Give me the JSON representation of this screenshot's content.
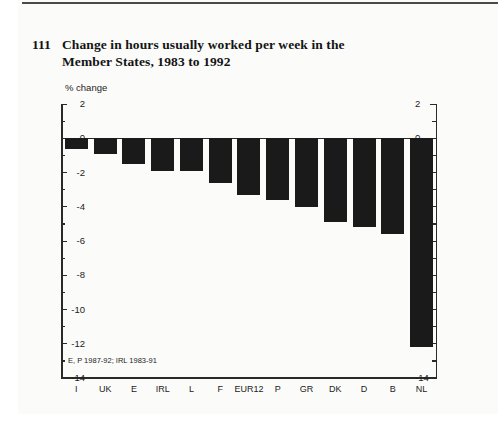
{
  "figure": {
    "number": "111",
    "title": "Change in hours usually worked per week in the Member States, 1983 to 1992"
  },
  "chart_data": {
    "type": "bar",
    "title": "Change in hours usually worked per week in the Member States, 1983 to 1992",
    "units_label": "% change",
    "xlabel": "",
    "ylabel": "% change",
    "categories": [
      "I",
      "UK",
      "E",
      "IRL",
      "L",
      "F",
      "EUR12",
      "P",
      "GR",
      "DK",
      "D",
      "B",
      "NL"
    ],
    "values": [
      -0.6,
      -0.9,
      -1.5,
      -1.9,
      -1.9,
      -2.6,
      -3.3,
      -3.6,
      -4.0,
      -4.9,
      -5.2,
      -5.6,
      -12.2
    ],
    "ylim": [
      2,
      -14
    ],
    "ytick_values": [
      2,
      0,
      -2,
      -4,
      -6,
      -8,
      -10,
      -12,
      -14
    ],
    "ytick_labels": [
      "2",
      "0",
      "-2",
      "-4",
      "-6",
      "-8",
      "-10",
      "-12",
      "-14"
    ],
    "minor_ytick_values": [
      1,
      -1,
      -3,
      -5,
      -7,
      -9,
      -11,
      -13
    ],
    "grid": false,
    "legend": "none",
    "bar_color": "#1a1a1a",
    "axis_color": "#2a2a2a",
    "right_axis_mirrored": true,
    "footnote": "E, P 1987-92; IRL 1983-91"
  }
}
